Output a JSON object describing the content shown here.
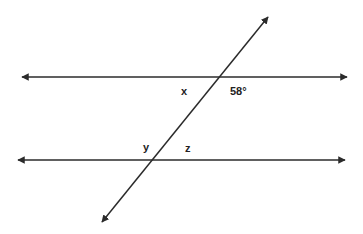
{
  "diagram": {
    "line_color": "#2b2b2b",
    "lines": [
      {
        "name": "top-parallel-line",
        "x1": 22,
        "y1": 77,
        "x2": 347,
        "y2": 77
      },
      {
        "name": "bottom-parallel-line",
        "x1": 18,
        "y1": 160,
        "x2": 345,
        "y2": 160
      },
      {
        "name": "transversal",
        "x1": 102,
        "y1": 222,
        "x2": 268,
        "y2": 17
      }
    ],
    "labels": {
      "x": "x",
      "angle_58": "58°",
      "y": "y",
      "z": "z"
    }
  }
}
